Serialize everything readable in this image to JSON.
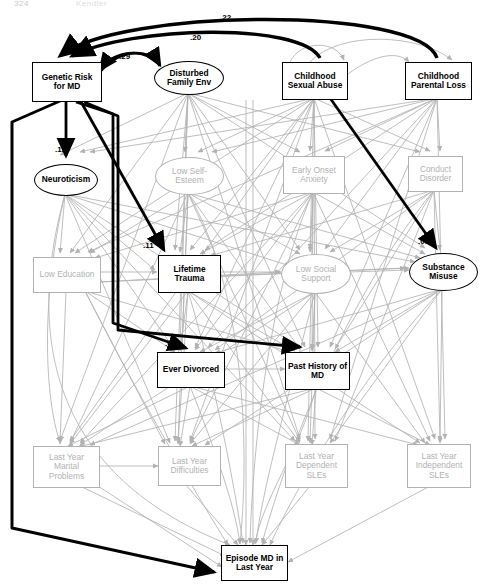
{
  "figure": {
    "type": "path-diagram",
    "header_left": "324",
    "header_right": "Kendler",
    "title": "",
    "significant_color": "#000000",
    "nonsignificant_color": "#b2b2b2"
  },
  "nodes": [
    {
      "id": "genetic_risk",
      "label": "Genetic Risk\nfor MD",
      "shape": "box",
      "emphasis": "black",
      "x": 32,
      "y": 62,
      "w": 68,
      "h": 38
    },
    {
      "id": "disturbed_family_env",
      "label": "Disturbed\nFamily Env",
      "shape": "ellipse",
      "emphasis": "black",
      "x": 154,
      "y": 61,
      "w": 68,
      "h": 32
    },
    {
      "id": "childhood_sexual_abuse",
      "label": "Childhood\nSexual Abuse",
      "shape": "box",
      "emphasis": "black",
      "x": 282,
      "y": 62,
      "w": 64,
      "h": 36
    },
    {
      "id": "childhood_parental_loss",
      "label": "Childhood\nParental Loss",
      "shape": "box",
      "emphasis": "black",
      "x": 405,
      "y": 62,
      "w": 65,
      "h": 36
    },
    {
      "id": "neuroticism",
      "label": "Neuroticism",
      "shape": "ellipse",
      "emphasis": "black",
      "x": 34,
      "y": 164,
      "w": 62,
      "h": 30
    },
    {
      "id": "low_self_esteem",
      "label": "Low Self-\nEsteem",
      "shape": "ellipse",
      "emphasis": "gray",
      "x": 155,
      "y": 157,
      "w": 67,
      "h": 36
    },
    {
      "id": "early_onset_anxiety",
      "label": "Early Onset\nAnxiety",
      "shape": "box",
      "emphasis": "gray",
      "x": 283,
      "y": 156,
      "w": 60,
      "h": 36
    },
    {
      "id": "conduct_disorder",
      "label": "Conduct\nDisorder",
      "shape": "box",
      "emphasis": "gray",
      "x": 408,
      "y": 156,
      "w": 53,
      "h": 34
    },
    {
      "id": "low_education",
      "label": "Low Education",
      "shape": "box",
      "emphasis": "gray",
      "x": 33,
      "y": 257,
      "w": 66,
      "h": 34
    },
    {
      "id": "lifetime_trauma",
      "label": "Lifetime\nTrauma",
      "shape": "box",
      "emphasis": "black",
      "x": 158,
      "y": 255,
      "w": 61,
      "h": 36
    },
    {
      "id": "low_social_support",
      "label": "Low Social\nSupport",
      "shape": "ellipse",
      "emphasis": "gray",
      "x": 281,
      "y": 254,
      "w": 68,
      "h": 38
    },
    {
      "id": "substance_misuse",
      "label": "Substance\nMisuse",
      "shape": "ellipse",
      "emphasis": "black",
      "x": 409,
      "y": 253,
      "w": 67,
      "h": 36
    },
    {
      "id": "ever_divorced",
      "label": "Ever Divorced",
      "shape": "box",
      "emphasis": "black",
      "x": 157,
      "y": 352,
      "w": 66,
      "h": 34
    },
    {
      "id": "past_history_md",
      "label": "Past History of\nMD",
      "shape": "box",
      "emphasis": "black",
      "x": 285,
      "y": 352,
      "w": 63,
      "h": 36
    },
    {
      "id": "last_year_marital_problems",
      "label": "Last Year\nMarital\nProblems",
      "shape": "box",
      "emphasis": "gray",
      "x": 33,
      "y": 446,
      "w": 65,
      "h": 40
    },
    {
      "id": "last_year_difficulties",
      "label": "Last Year\nDifficulties",
      "shape": "box",
      "emphasis": "gray",
      "x": 158,
      "y": 446,
      "w": 61,
      "h": 38
    },
    {
      "id": "last_year_dependent_sles",
      "label": "Last Year\nDependent\nSLEs",
      "shape": "box",
      "emphasis": "gray",
      "x": 285,
      "y": 444,
      "w": 61,
      "h": 42
    },
    {
      "id": "last_year_independent_sles",
      "label": "Last Year\nIndependent\nSLEs",
      "shape": "box",
      "emphasis": "gray",
      "x": 407,
      "y": 444,
      "w": 62,
      "h": 42
    },
    {
      "id": "episode_md_last_year",
      "label": "Episode MD in\nLast Year",
      "shape": "box",
      "emphasis": "black",
      "x": 221,
      "y": 545,
      "w": 65,
      "h": 34
    }
  ],
  "path_labels": [
    {
      "id": "g_to_cpl",
      "value": ".22",
      "x": 220,
      "y": 13
    },
    {
      "id": "g_to_csa",
      "value": ".20",
      "x": 190,
      "y": 33
    },
    {
      "id": "g_to_dfe",
      "value": ".29",
      "x": 119,
      "y": 52
    },
    {
      "id": "g_to_neuro",
      "value": ".12",
      "x": 55,
      "y": 145
    },
    {
      "id": "g_to_trauma",
      "value": ".11",
      "x": 143,
      "y": 241
    },
    {
      "id": "csa_to_subst",
      "value": ".09",
      "x": 418,
      "y": 237
    },
    {
      "id": "g_to_divorced",
      "value": ".08",
      "x": 165,
      "y": 339
    },
    {
      "id": "g_to_pasthx",
      "value": ".11",
      "x": 281,
      "y": 339
    },
    {
      "id": "g_to_episode",
      "value": ".10",
      "x": 196,
      "y": 565
    }
  ]
}
